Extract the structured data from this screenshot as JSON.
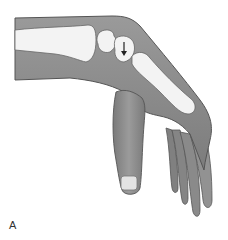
{
  "figure": {
    "panel_label": "A",
    "annotations": [
      {
        "type": "arrow",
        "direction": "down",
        "location": "lunate carpal bone"
      }
    ],
    "colors": {
      "skin": "#8e8e8e",
      "skin_shadow": "#6f6f6f",
      "bone": "#f2f2f2",
      "outline": "#444444",
      "nail": "#e6e6e6"
    }
  }
}
